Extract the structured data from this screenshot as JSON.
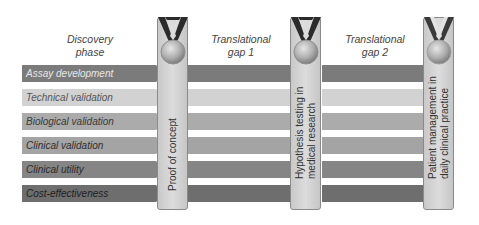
{
  "phases": {
    "discovery": "Discovery\nphase",
    "discovery_line1": "Discovery",
    "discovery_line2": "phase",
    "gap1_line1": "Translational",
    "gap1_line2": "gap 1",
    "gap2_line1": "Translational",
    "gap2_line2": "gap 2"
  },
  "rows": [
    {
      "label": "Assay development",
      "color": "#7b7b7b",
      "text_color": "#e8e8e8"
    },
    {
      "label": "Technical validation",
      "color": "#d2d2d2",
      "text_color": "#555555"
    },
    {
      "label": "Biological validation",
      "color": "#ababab",
      "text_color": "#3a3a3a"
    },
    {
      "label": "Clinical validation",
      "color": "#a4a4a4",
      "text_color": "#2e2e2e"
    },
    {
      "label": "Clinical utility",
      "color": "#858585",
      "text_color": "#2a2a2a"
    },
    {
      "label": "Cost-effectiveness",
      "color": "#6e6e6e",
      "text_color": "#1e1e1e"
    }
  ],
  "milestones": [
    {
      "line1": "Proof of concept",
      "line2": "",
      "medal": "medal-icon"
    },
    {
      "line1": "Hypothesis testing in",
      "line2": "medical research",
      "medal": "medal-icon"
    },
    {
      "line1": "Patient management in",
      "line2": "daily clinical practice",
      "medal": "medal-icon"
    }
  ]
}
